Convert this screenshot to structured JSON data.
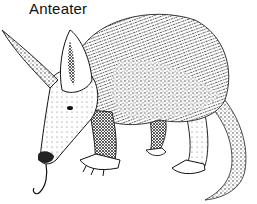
{
  "caption": "Anteater",
  "illustration": {
    "subject": "anteater",
    "style": "black-and-white pen-and-ink stippled drawing",
    "colors": {
      "ink": "#111111",
      "background": "#ffffff"
    }
  }
}
